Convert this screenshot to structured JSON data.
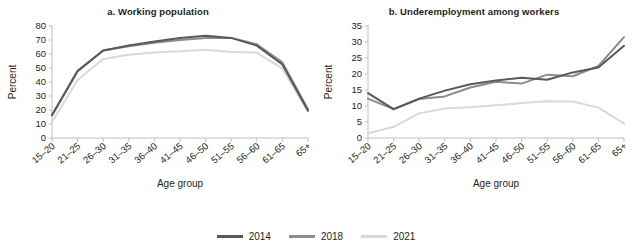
{
  "figure": {
    "legend": {
      "items": [
        {
          "label": "2014",
          "color": "#595959"
        },
        {
          "label": "2018",
          "color": "#8c8c8c"
        },
        {
          "label": "2021",
          "color": "#d9d9d9"
        }
      ]
    }
  },
  "chart_data": [
    {
      "type": "line",
      "panel_id": "a",
      "title": "a. Working population",
      "xlabel": "Age group",
      "ylabel": "Percent",
      "categories": [
        "15–20",
        "21–25",
        "26–30",
        "31–35",
        "36–40",
        "41–45",
        "46–50",
        "51–55",
        "56–60",
        "61–65",
        "65+"
      ],
      "ylim": [
        0,
        80
      ],
      "yticks": [
        0,
        10,
        20,
        30,
        40,
        50,
        60,
        70,
        80
      ],
      "grid": false,
      "legend_position": "bottom-center",
      "series": [
        {
          "name": "2014",
          "color": "#595959",
          "values": [
            16.5,
            48.0,
            62.5,
            66.0,
            69.0,
            71.5,
            73.0,
            71.5,
            66.0,
            52.5,
            19.5
          ]
        },
        {
          "name": "2018",
          "color": "#8c8c8c",
          "values": [
            16.0,
            47.5,
            62.5,
            65.5,
            68.0,
            70.0,
            71.5,
            71.5,
            67.0,
            54.0,
            20.5
          ]
        },
        {
          "name": "2021",
          "color": "#d9d9d9",
          "values": [
            11.5,
            41.5,
            56.5,
            59.5,
            61.0,
            62.0,
            63.0,
            61.5,
            61.0,
            49.5,
            19.0
          ]
        }
      ]
    },
    {
      "type": "line",
      "panel_id": "b",
      "title": "b. Underemployment among workers",
      "xlabel": "Age group",
      "ylabel": "Percent",
      "categories": [
        "15–20",
        "21–25",
        "26–30",
        "31–35",
        "36–40",
        "41–45",
        "46–50",
        "51–55",
        "56–60",
        "61–65",
        "65+"
      ],
      "ylim": [
        0,
        35
      ],
      "yticks": [
        0,
        5,
        10,
        15,
        20,
        25,
        30,
        35
      ],
      "grid": false,
      "legend_position": "bottom-center",
      "series": [
        {
          "name": "2014",
          "color": "#595959",
          "values": [
            14.0,
            9.0,
            12.3,
            14.8,
            16.8,
            18.0,
            18.8,
            18.2,
            20.5,
            22.0,
            28.8
          ]
        },
        {
          "name": "2018",
          "color": "#8c8c8c",
          "values": [
            12.3,
            9.0,
            12.2,
            13.0,
            15.8,
            17.6,
            17.0,
            19.8,
            19.3,
            22.5,
            31.5
          ]
        },
        {
          "name": "2021",
          "color": "#d9d9d9",
          "values": [
            1.5,
            3.5,
            7.7,
            9.2,
            9.6,
            10.2,
            10.9,
            11.5,
            11.4,
            9.5,
            4.5
          ]
        }
      ]
    }
  ]
}
